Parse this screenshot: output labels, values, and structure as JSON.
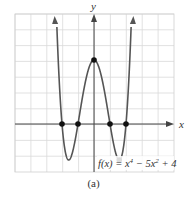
{
  "chart_data": {
    "type": "line",
    "title": "",
    "function_label": "f(x) = x⁴ − 5x² + 4",
    "xlabel": "x",
    "ylabel": "y",
    "xlim": [
      -5,
      5
    ],
    "ylim": [
      -3,
      7
    ],
    "grid": true,
    "x_intercepts": [
      -2,
      -1,
      1,
      2
    ],
    "y_intercept": [
      0,
      4
    ],
    "local_minima": [
      [
        -1.58,
        -2.25
      ],
      [
        1.58,
        -2.25
      ]
    ],
    "local_maximum": [
      0,
      4
    ],
    "highlighted_points": [
      [
        -2,
        0
      ],
      [
        -1,
        0
      ],
      [
        1,
        0
      ],
      [
        2,
        0
      ],
      [
        0,
        4
      ],
      [
        1.58,
        -2.25
      ]
    ]
  },
  "caption": "(a)",
  "labels": {
    "x_axis": "x",
    "y_axis": "y",
    "func_prefix": "f(x) = x",
    "func_mid": " − 5x",
    "func_suffix": " + 4",
    "exp4": "4",
    "exp2": "2"
  }
}
